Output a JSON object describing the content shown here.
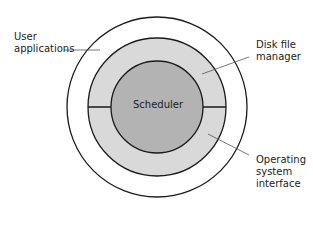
{
  "diagram": {
    "center_label": "Scheduler",
    "labels": {
      "user_applications": [
        "User",
        "applications"
      ],
      "disk_file_manager": [
        "Disk file",
        "manager"
      ],
      "os_interface": [
        "Operating",
        "system",
        "interface"
      ]
    },
    "colors": {
      "outer_ring": "#ffffff",
      "middle_ring": "#d9d9d9",
      "inner_circle": "#b3b3b3",
      "stroke": "#1a1a1a",
      "leader": "#555555"
    }
  }
}
